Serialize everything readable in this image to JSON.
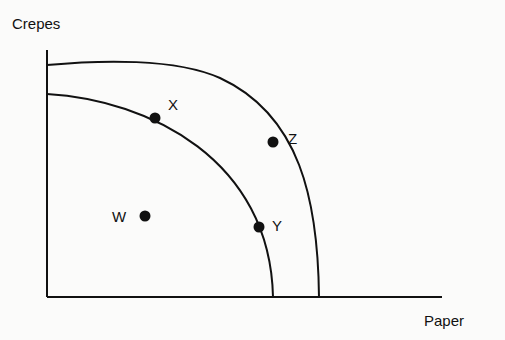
{
  "axes": {
    "y_label": "Crepes",
    "x_label": "Paper"
  },
  "curves": [
    {
      "name": "inner-ppf",
      "points_on_curve": [
        "X",
        "Y"
      ]
    },
    {
      "name": "outer-ppf",
      "points_on_curve": [
        "Z"
      ]
    }
  ],
  "points": [
    {
      "label": "X",
      "location": "on inner curve"
    },
    {
      "label": "Y",
      "location": "on inner curve"
    },
    {
      "label": "Z",
      "location": "on outer curve"
    },
    {
      "label": "W",
      "location": "inside inner curve"
    }
  ],
  "colors": {
    "line": "#111111",
    "background": "#fbfbfa"
  }
}
